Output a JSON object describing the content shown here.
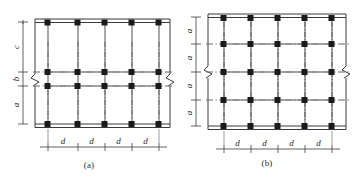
{
  "figure": {
    "colors": {
      "line": "#3a3a3a",
      "grid_solid": "#8a8a8a",
      "grid_dashdot": "#6a6a6a",
      "node": "#1a1a1a",
      "text": "#2b2b2b",
      "background": "#ffffff"
    },
    "panels": [
      {
        "id": "a",
        "caption": "(a)",
        "columns": 5,
        "rows": 4,
        "vertical_dims": [
          {
            "label": "c",
            "span": "top-to-row2"
          },
          {
            "label": "b",
            "span": "row2-to-row3"
          },
          {
            "label": "a",
            "span": "row3-to-bottom"
          }
        ],
        "horizontal_dims": [
          {
            "label": "d"
          },
          {
            "label": "d"
          },
          {
            "label": "d"
          },
          {
            "label": "d"
          }
        ],
        "break_marks": [
          "left",
          "right"
        ],
        "beams": [
          "top",
          "bottom"
        ]
      },
      {
        "id": "b",
        "caption": "(b)",
        "columns": 5,
        "rows": 5,
        "vertical_dims": [
          {
            "label": "a",
            "span": "row1-to-row2"
          },
          {
            "label": "a",
            "span": "row2-to-row3"
          },
          {
            "label": "a",
            "span": "row3-to-row4"
          },
          {
            "label": "a",
            "span": "row4-to-row5"
          }
        ],
        "horizontal_dims": [
          {
            "label": "d"
          },
          {
            "label": "d"
          },
          {
            "label": "d"
          },
          {
            "label": "d"
          }
        ],
        "break_marks": [
          "left",
          "right"
        ],
        "beams": [
          "top",
          "bottom"
        ]
      }
    ]
  }
}
